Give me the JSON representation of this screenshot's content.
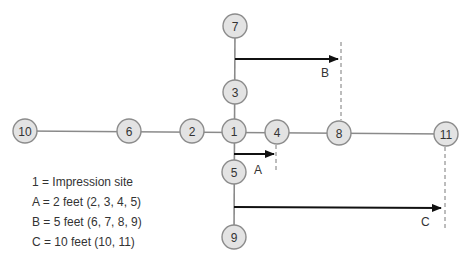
{
  "diagram": {
    "nodes": [
      {
        "id": "1",
        "x": 234,
        "y": 131
      },
      {
        "id": "2",
        "x": 192,
        "y": 131
      },
      {
        "id": "3",
        "x": 235,
        "y": 92
      },
      {
        "id": "4",
        "x": 277,
        "y": 132
      },
      {
        "id": "5",
        "x": 234,
        "y": 172
      },
      {
        "id": "6",
        "x": 129,
        "y": 131
      },
      {
        "id": "7",
        "x": 235,
        "y": 26
      },
      {
        "id": "8",
        "x": 339,
        "y": 133
      },
      {
        "id": "9",
        "x": 234,
        "y": 237
      },
      {
        "id": "10",
        "x": 25,
        "y": 131
      },
      {
        "id": "11",
        "x": 446,
        "y": 134
      }
    ],
    "distance_labels": {
      "a": "A",
      "b": "B",
      "c": "C"
    },
    "colors": {
      "node_fill": "#e3e3e3",
      "node_stroke": "#8c8c8c",
      "arrow": "#111111",
      "connector": "#8a8a8a"
    }
  },
  "legend": {
    "items": [
      "1 = Impression site",
      "A = 2 feet (2, 3, 4, 5)",
      "B = 5 feet (6, 7, 8, 9)",
      "C = 10 feet (10, 11)"
    ]
  }
}
